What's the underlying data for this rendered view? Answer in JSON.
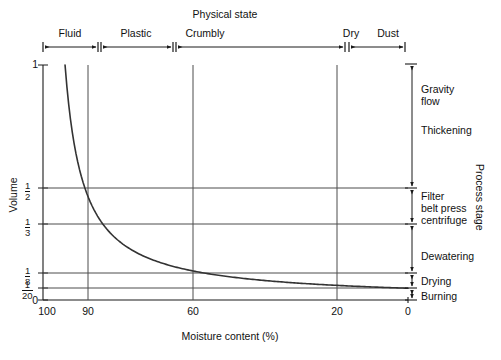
{
  "chart_data": {
    "type": "line",
    "title": "",
    "xlabel": "Moisture content (%)",
    "ylabel": "Volume",
    "xlim": [
      100,
      0
    ],
    "ylim": [
      0,
      1
    ],
    "xticks": [
      100,
      90,
      60,
      20,
      0
    ],
    "xticklabels": [
      "100",
      "90",
      "60",
      "20",
      "0"
    ],
    "yticks": [
      1,
      0.5,
      0.3333,
      0.125,
      0.05,
      0
    ],
    "yticklabels": [
      "1",
      "1/2",
      "1/3",
      "1/8",
      "1/20",
      "0"
    ],
    "grid": true,
    "legend": "none",
    "series": [
      {
        "name": "Sludge volume",
        "relation": "V = 5 / (100 - moisture)",
        "x": [
          95,
          94,
          93,
          92,
          91,
          90,
          88,
          86,
          84,
          82,
          80,
          75,
          70,
          65,
          60,
          55,
          50,
          45,
          40,
          30,
          20,
          10,
          0
        ],
        "y": [
          1.0,
          0.833,
          0.714,
          0.625,
          0.556,
          0.5,
          0.417,
          0.357,
          0.313,
          0.278,
          0.25,
          0.2,
          0.167,
          0.143,
          0.125,
          0.111,
          0.1,
          0.091,
          0.083,
          0.071,
          0.063,
          0.056,
          0.05
        ]
      }
    ],
    "annotated_points": [
      {
        "x": 95,
        "y": 1,
        "note": "curve origin at top axis"
      },
      {
        "x": 90,
        "y": 0.5,
        "note": "curve crosses 1/2 at 90%"
      },
      {
        "x": 60,
        "y": 0.125,
        "note": "curve crosses 1/8 at 60%"
      },
      {
        "x": 0,
        "y": 0.05,
        "note": "curve ends at 1/20"
      }
    ]
  },
  "top_axis": {
    "title": "Physical state",
    "segments": [
      {
        "label": "Fluid",
        "x_start": 100,
        "x_end": 85
      },
      {
        "label": "Plastic",
        "x_start": 84,
        "x_end": 65
      },
      {
        "label": "Crumbly",
        "x_start": 64,
        "x_end": 18
      },
      {
        "label": "Dry",
        "x_start": 64,
        "x_end": 18
      },
      {
        "label": "Dust",
        "x_start": 17,
        "x_end": 0
      }
    ]
  },
  "right_axis": {
    "title": "Process stage",
    "stages": [
      {
        "label": "Gravity\nflow",
        "line1": "Gravity",
        "line2": "flow"
      },
      {
        "label": "Thickening",
        "line1": "Thickening",
        "line2": ""
      },
      {
        "label": "Filter belt press centrifuge",
        "line1": "Filter",
        "line2": "belt press",
        "line3": "centrifuge"
      },
      {
        "label": "Dewatering",
        "line1": "Dewatering",
        "line2": ""
      },
      {
        "label": "Drying",
        "line1": "Drying",
        "line2": ""
      },
      {
        "label": "Burning",
        "line1": "Burning",
        "line2": ""
      }
    ]
  },
  "colors": {
    "axis": "#1a1a1a",
    "grid": "#4d4d4d",
    "curve": "#333333",
    "background": "#ffffff",
    "text": "#111111"
  }
}
